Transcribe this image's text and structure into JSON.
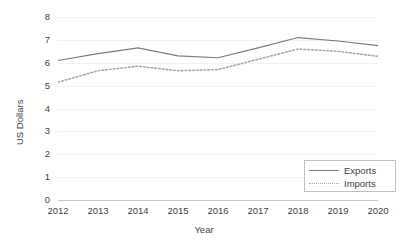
{
  "chart_data": {
    "type": "line",
    "title": "",
    "xlabel": "Year",
    "ylabel": "US Dollars",
    "categories": [
      "2012",
      "2013",
      "2014",
      "2015",
      "2016",
      "2017",
      "2018",
      "2019",
      "2020"
    ],
    "x": [
      2012,
      2013,
      2014,
      2015,
      2016,
      2017,
      2018,
      2019,
      2020
    ],
    "series": [
      {
        "name": "Exports",
        "style": "solid",
        "color": "#7a7a7a",
        "values": [
          6.1,
          6.4,
          6.65,
          6.3,
          6.22,
          6.65,
          7.1,
          6.95,
          6.75
        ]
      },
      {
        "name": "Imports",
        "style": "dotted",
        "color": "#a8a8a8",
        "values": [
          5.15,
          5.65,
          5.85,
          5.65,
          5.7,
          6.15,
          6.6,
          6.5,
          6.28
        ]
      }
    ],
    "ylim": [
      0,
      8
    ],
    "yticks": [
      0,
      1,
      2,
      3,
      4,
      5,
      6,
      7,
      8
    ],
    "ytick_labels": [
      "0",
      "1",
      "2",
      "3",
      "4",
      "5",
      "6",
      "7",
      "8"
    ],
    "grid": true,
    "grid_color": "#f2f2f2",
    "axis_color": "#c8c8c8",
    "legend_position": "bottom-right",
    "legend_entries": [
      "Exports",
      "Imports"
    ]
  }
}
